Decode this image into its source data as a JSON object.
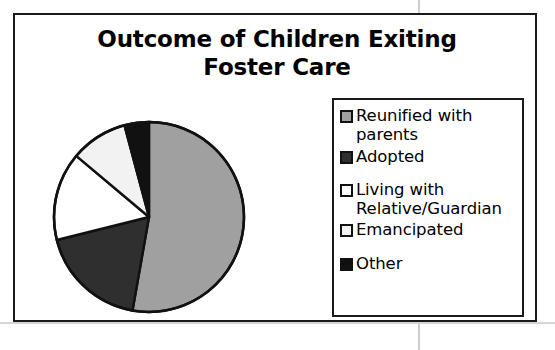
{
  "chart_frame": {
    "title_line_1": "Outcome of Children Exiting",
    "title_line_2": "Foster Care"
  },
  "legend": {
    "items": [
      {
        "label": "Reunified with\nparents",
        "swatch_color": "#a0a0a0",
        "swatch_name": "legend-swatch-reunified"
      },
      {
        "label": "Adopted",
        "swatch_color": "#2f2f2f",
        "swatch_name": "legend-swatch-adopted"
      },
      {
        "label": "Living with\nRelative/Guardian",
        "swatch_color": "#ffffff",
        "swatch_name": "legend-swatch-relative"
      },
      {
        "label": "Emancipated",
        "swatch_color": "#f2f2f2",
        "swatch_name": "legend-swatch-emancipated"
      },
      {
        "label": "Other",
        "swatch_color": "#111111",
        "swatch_name": "legend-swatch-other"
      }
    ]
  },
  "chart_data": {
    "type": "pie",
    "title": "Outcome of Children Exiting Foster Care",
    "xlabel": "",
    "ylabel": "",
    "legend_position": "right",
    "grid": false,
    "start_angle_deg": 0,
    "direction": "clockwise",
    "categories": [
      "Reunified with parents",
      "Adopted",
      "Living with Relative/Guardian",
      "Emancipated",
      "Other"
    ],
    "values": [
      53,
      18,
      15,
      10,
      4
    ],
    "units": "percent",
    "colors": [
      "#a0a0a0",
      "#2f2f2f",
      "#ffffff",
      "#f2f2f2",
      "#111111"
    ],
    "slices": [
      {
        "label": "Reunified with parents",
        "value": 53,
        "start_deg": 0,
        "end_deg": 190,
        "color": "#a0a0a0"
      },
      {
        "label": "Adopted",
        "value": 18,
        "start_deg": 190,
        "end_deg": 256,
        "color": "#2f2f2f"
      },
      {
        "label": "Living with Relative/Guardian",
        "value": 15,
        "start_deg": 256,
        "end_deg": 310,
        "color": "#ffffff"
      },
      {
        "label": "Emancipated",
        "value": 10,
        "start_deg": 310,
        "end_deg": 345,
        "color": "#f2f2f2"
      },
      {
        "label": "Other",
        "value": 4,
        "start_deg": 345,
        "end_deg": 360,
        "color": "#111111"
      }
    ]
  }
}
